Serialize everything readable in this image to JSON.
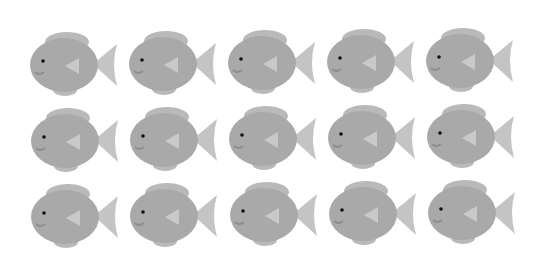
{
  "scene": {
    "description": "Grid of 15 identical grey cartoon fish facing left",
    "rows": 3,
    "columns": 5,
    "count": 15
  },
  "colors": {
    "background": "#ffffff",
    "body": "#a9a9a9",
    "body_shade": "#9c9c9c",
    "dorsal_fin": "#b9b9b9",
    "tail_fin": "#c4c4c4",
    "side_fin": "#c9c9c9",
    "eye": "#111111",
    "mouth": "#8e8e8e"
  },
  "fish": [
    {
      "row": 0,
      "col": 0,
      "x": 27,
      "y": 28
    },
    {
      "row": 0,
      "col": 1,
      "x": 126,
      "y": 27
    },
    {
      "row": 0,
      "col": 2,
      "x": 225,
      "y": 26
    },
    {
      "row": 0,
      "col": 3,
      "x": 324,
      "y": 25
    },
    {
      "row": 0,
      "col": 4,
      "x": 423,
      "y": 24
    },
    {
      "row": 1,
      "col": 0,
      "x": 28,
      "y": 104
    },
    {
      "row": 1,
      "col": 1,
      "x": 127,
      "y": 103
    },
    {
      "row": 1,
      "col": 2,
      "x": 226,
      "y": 102
    },
    {
      "row": 1,
      "col": 3,
      "x": 325,
      "y": 101
    },
    {
      "row": 1,
      "col": 4,
      "x": 424,
      "y": 100
    },
    {
      "row": 2,
      "col": 0,
      "x": 28,
      "y": 180
    },
    {
      "row": 2,
      "col": 1,
      "x": 127,
      "y": 179
    },
    {
      "row": 2,
      "col": 2,
      "x": 227,
      "y": 178
    },
    {
      "row": 2,
      "col": 3,
      "x": 326,
      "y": 177
    },
    {
      "row": 2,
      "col": 4,
      "x": 425,
      "y": 176
    }
  ]
}
